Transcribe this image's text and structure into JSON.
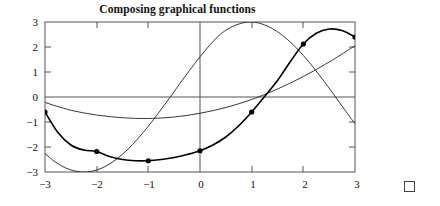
{
  "figure": {
    "title": "Composing graphical functions",
    "end_marker": "square-marker"
  },
  "chart_data": {
    "type": "line",
    "title": "Composing graphical functions",
    "xlabel": "",
    "ylabel": "",
    "xlim": [
      -3,
      3
    ],
    "ylim": [
      -3,
      3
    ],
    "xticks": [
      -3,
      -2,
      -1,
      0,
      1,
      2,
      3
    ],
    "yticks": [
      -3,
      -2,
      -1,
      0,
      1,
      2,
      3
    ],
    "xticklabels": [
      "−3",
      "−2",
      "−1",
      "0",
      "1",
      "2",
      "3"
    ],
    "yticklabels": [
      "−3",
      "−2",
      "−1",
      "0",
      "1",
      "2",
      "3"
    ],
    "grid": false,
    "legend_position": "inline-annotations",
    "annotations": [
      {
        "text": "f",
        "x": 0.55,
        "y": 1.05
      },
      {
        "text": "g",
        "x": -1.6,
        "y": -0.62
      },
      {
        "text": "f ∘ g",
        "x": 1.05,
        "y": -1.62
      }
    ],
    "series": [
      {
        "name": "f",
        "label": "f",
        "color": "#222222",
        "linewidth": 0.9,
        "markers": false,
        "description": "sine-like curve, zero at x=0, maximum 3 near x=1.6, minimum -3 near x=-1.6",
        "x": [
          -3.0,
          -2.8,
          -2.6,
          -2.4,
          -2.2,
          -2.0,
          -1.8,
          -1.6,
          -1.4,
          -1.2,
          -1.0,
          -0.8,
          -0.6,
          -0.4,
          -0.2,
          0.0,
          0.2,
          0.4,
          0.6,
          0.8,
          1.0,
          1.2,
          1.4,
          1.6,
          1.8,
          2.0,
          2.2,
          2.4,
          2.6,
          2.8,
          3.0
        ],
        "y": [
          -2.26,
          -2.6,
          -2.84,
          -2.97,
          -3.0,
          -2.92,
          -2.74,
          -2.46,
          -2.1,
          -1.66,
          -1.17,
          -0.63,
          -0.07,
          0.51,
          1.07,
          1.61,
          2.1,
          2.52,
          2.79,
          2.95,
          3.0,
          2.92,
          2.74,
          2.46,
          2.1,
          1.66,
          1.17,
          0.63,
          0.07,
          -0.51,
          -1.07
        ]
      },
      {
        "name": "g",
        "label": "g",
        "color": "#222222",
        "linewidth": 0.9,
        "markers": false,
        "description": "shallow upward curve, minimum about -0.85 near x=-1, crosses zero near x=1.25, reaches about 2.05 at x=3",
        "x": [
          -3.0,
          -2.5,
          -2.0,
          -1.5,
          -1.0,
          -0.5,
          0.0,
          0.5,
          1.0,
          1.5,
          2.0,
          2.5,
          3.0
        ],
        "y": [
          -0.22,
          -0.53,
          -0.72,
          -0.83,
          -0.86,
          -0.8,
          -0.65,
          -0.42,
          -0.1,
          0.32,
          0.82,
          1.4,
          2.05
        ]
      },
      {
        "name": "f_compose_g",
        "label": "f ∘ g",
        "color": "#000000",
        "linewidth": 1.6,
        "markers": true,
        "description": "composition f(g(x)); marked sample points at integer x values",
        "x": [
          -3.0,
          -2.75,
          -2.5,
          -2.25,
          -2.0,
          -1.75,
          -1.5,
          -1.25,
          -1.0,
          -0.75,
          -0.5,
          -0.25,
          0.0,
          0.25,
          0.5,
          0.75,
          1.0,
          1.25,
          1.5,
          1.75,
          2.0,
          2.25,
          2.5,
          2.75,
          3.0
        ],
        "y": [
          -0.6,
          -1.42,
          -1.92,
          -2.12,
          -2.18,
          -2.38,
          -2.5,
          -2.55,
          -2.55,
          -2.5,
          -2.42,
          -2.3,
          -2.15,
          -1.92,
          -1.6,
          -1.15,
          -0.6,
          0.02,
          0.66,
          1.42,
          2.12,
          2.55,
          2.72,
          2.66,
          2.4
        ]
      }
    ],
    "marked_points": [
      {
        "x": -3,
        "y": -0.6
      },
      {
        "x": -2,
        "y": -2.18
      },
      {
        "x": -1,
        "y": -2.55
      },
      {
        "x": 0,
        "y": -2.15
      },
      {
        "x": 1,
        "y": -0.6
      },
      {
        "x": 2,
        "y": 2.12
      },
      {
        "x": 3,
        "y": 2.4
      }
    ]
  }
}
